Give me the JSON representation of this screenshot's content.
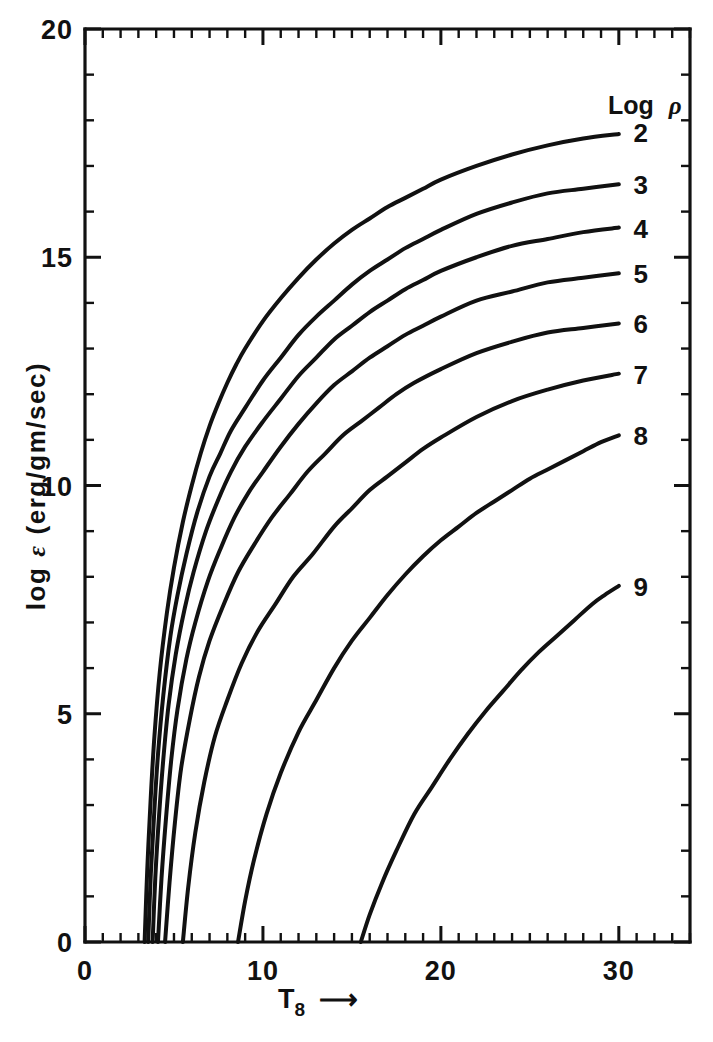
{
  "chart_data": {
    "type": "line",
    "title": "",
    "xlabel": "T8",
    "xlabel_display": "T",
    "xlabel_sub": "8",
    "xlabel_arrow": "⟶",
    "ylabel": "log ε (erg/gm/sec)",
    "ylabel_parts": {
      "prefix": "log",
      "symbol": "ε",
      "units": "(erg/gm/sec)"
    },
    "xlim": [
      0,
      34
    ],
    "ylim": [
      0,
      20
    ],
    "x_major_ticks": [
      0,
      10,
      20,
      30
    ],
    "x_major_tick_labels": [
      "0",
      "10",
      "20",
      "30"
    ],
    "x_minor_tick_interval": 1,
    "y_major_ticks": [
      0,
      5,
      10,
      15,
      20
    ],
    "y_major_tick_labels": [
      "0",
      "5",
      "10",
      "15",
      "20"
    ],
    "y_minor_tick_interval": 1,
    "grid": false,
    "legend_position": "right-inline",
    "legend_title": "Log ρ",
    "legend_title_parts": {
      "text": "Log",
      "symbol": "ρ"
    },
    "series": [
      {
        "name": "2",
        "label": "2",
        "label_x": 30.6,
        "label_y": 17.75,
        "x_intercept": 3.35,
        "y_at_30": 17.7,
        "points": [
          [
            3.35,
            0.0
          ],
          [
            3.5,
            1.6
          ],
          [
            3.7,
            3.2
          ],
          [
            3.9,
            4.5
          ],
          [
            4.2,
            5.9
          ],
          [
            4.6,
            7.2
          ],
          [
            5.0,
            8.2
          ],
          [
            5.5,
            9.2
          ],
          [
            6.0,
            10.0
          ],
          [
            6.5,
            10.7
          ],
          [
            7.0,
            11.3
          ],
          [
            7.5,
            11.8
          ],
          [
            8.0,
            12.25
          ],
          [
            8.5,
            12.65
          ],
          [
            9.0,
            13.0
          ],
          [
            10.0,
            13.6
          ],
          [
            11.0,
            14.1
          ],
          [
            12.0,
            14.55
          ],
          [
            13.0,
            14.95
          ],
          [
            14.0,
            15.3
          ],
          [
            15.0,
            15.6
          ],
          [
            16.0,
            15.85
          ],
          [
            17.0,
            16.1
          ],
          [
            18.0,
            16.3
          ],
          [
            19.0,
            16.5
          ],
          [
            20.0,
            16.7
          ],
          [
            22.0,
            17.0
          ],
          [
            24.0,
            17.25
          ],
          [
            26.0,
            17.45
          ],
          [
            28.0,
            17.6
          ],
          [
            30.0,
            17.7
          ]
        ]
      },
      {
        "name": "3",
        "label": "3",
        "label_x": 30.6,
        "label_y": 16.6,
        "x_intercept": 3.55,
        "y_at_30": 16.6,
        "points": [
          [
            3.55,
            0.0
          ],
          [
            3.7,
            1.5
          ],
          [
            3.9,
            2.9
          ],
          [
            4.1,
            4.1
          ],
          [
            4.4,
            5.4
          ],
          [
            4.8,
            6.7
          ],
          [
            5.2,
            7.6
          ],
          [
            5.7,
            8.5
          ],
          [
            6.3,
            9.4
          ],
          [
            7.0,
            10.2
          ],
          [
            7.6,
            10.7
          ],
          [
            8.2,
            11.2
          ],
          [
            9.0,
            11.7
          ],
          [
            10.0,
            12.3
          ],
          [
            11.0,
            12.8
          ],
          [
            12.0,
            13.3
          ],
          [
            13.0,
            13.7
          ],
          [
            14.0,
            14.05
          ],
          [
            15.0,
            14.4
          ],
          [
            16.0,
            14.7
          ],
          [
            17.0,
            14.95
          ],
          [
            18.0,
            15.2
          ],
          [
            19.0,
            15.4
          ],
          [
            20.0,
            15.6
          ],
          [
            22.0,
            15.95
          ],
          [
            24.0,
            16.2
          ],
          [
            26.0,
            16.4
          ],
          [
            28.0,
            16.5
          ],
          [
            30.0,
            16.6
          ]
        ]
      },
      {
        "name": "4",
        "label": "4",
        "label_x": 30.6,
        "label_y": 15.65,
        "x_intercept": 3.8,
        "y_at_30": 15.65,
        "points": [
          [
            3.8,
            0.0
          ],
          [
            3.95,
            1.4
          ],
          [
            4.15,
            2.7
          ],
          [
            4.4,
            4.0
          ],
          [
            4.7,
            5.2
          ],
          [
            5.1,
            6.3
          ],
          [
            5.6,
            7.3
          ],
          [
            6.1,
            8.1
          ],
          [
            6.8,
            9.0
          ],
          [
            7.5,
            9.7
          ],
          [
            8.2,
            10.3
          ],
          [
            9.0,
            10.85
          ],
          [
            10.0,
            11.4
          ],
          [
            11.0,
            11.9
          ],
          [
            12.0,
            12.4
          ],
          [
            13.0,
            12.8
          ],
          [
            14.0,
            13.2
          ],
          [
            15.0,
            13.5
          ],
          [
            16.0,
            13.8
          ],
          [
            17.0,
            14.05
          ],
          [
            18.0,
            14.3
          ],
          [
            19.0,
            14.5
          ],
          [
            20.0,
            14.7
          ],
          [
            22.0,
            15.0
          ],
          [
            24.0,
            15.25
          ],
          [
            26.0,
            15.4
          ],
          [
            28.0,
            15.55
          ],
          [
            30.0,
            15.65
          ]
        ]
      },
      {
        "name": "5",
        "label": "5",
        "label_x": 30.6,
        "label_y": 14.65,
        "x_intercept": 4.1,
        "y_at_30": 14.65,
        "points": [
          [
            4.1,
            0.0
          ],
          [
            4.3,
            1.4
          ],
          [
            4.55,
            2.7
          ],
          [
            4.85,
            4.0
          ],
          [
            5.2,
            5.1
          ],
          [
            5.7,
            6.2
          ],
          [
            6.2,
            7.0
          ],
          [
            6.9,
            7.9
          ],
          [
            7.6,
            8.6
          ],
          [
            8.4,
            9.3
          ],
          [
            9.2,
            9.85
          ],
          [
            10.0,
            10.3
          ],
          [
            11.0,
            10.85
          ],
          [
            12.0,
            11.35
          ],
          [
            13.0,
            11.8
          ],
          [
            14.0,
            12.2
          ],
          [
            15.0,
            12.5
          ],
          [
            16.0,
            12.8
          ],
          [
            17.0,
            13.05
          ],
          [
            18.0,
            13.3
          ],
          [
            19.0,
            13.5
          ],
          [
            20.0,
            13.7
          ],
          [
            22.0,
            14.05
          ],
          [
            24.0,
            14.25
          ],
          [
            26.0,
            14.45
          ],
          [
            28.0,
            14.55
          ],
          [
            30.0,
            14.65
          ]
        ]
      },
      {
        "name": "6",
        "label": "6",
        "label_x": 30.6,
        "label_y": 13.55,
        "x_intercept": 4.5,
        "y_at_30": 13.55,
        "points": [
          [
            4.5,
            0.0
          ],
          [
            4.75,
            1.3
          ],
          [
            5.05,
            2.6
          ],
          [
            5.4,
            3.8
          ],
          [
            5.9,
            4.9
          ],
          [
            6.4,
            5.8
          ],
          [
            7.0,
            6.6
          ],
          [
            7.8,
            7.4
          ],
          [
            8.6,
            8.1
          ],
          [
            9.5,
            8.7
          ],
          [
            10.5,
            9.3
          ],
          [
            11.5,
            9.8
          ],
          [
            12.5,
            10.3
          ],
          [
            13.5,
            10.7
          ],
          [
            14.5,
            11.1
          ],
          [
            15.5,
            11.4
          ],
          [
            16.5,
            11.7
          ],
          [
            17.5,
            12.0
          ],
          [
            18.5,
            12.25
          ],
          [
            20.0,
            12.55
          ],
          [
            22.0,
            12.9
          ],
          [
            24.0,
            13.15
          ],
          [
            26.0,
            13.35
          ],
          [
            28.0,
            13.45
          ],
          [
            30.0,
            13.55
          ]
        ]
      },
      {
        "name": "7",
        "label": "7",
        "label_x": 30.6,
        "label_y": 12.45,
        "x_intercept": 5.5,
        "y_at_30": 12.45,
        "points": [
          [
            5.5,
            0.0
          ],
          [
            5.8,
            1.2
          ],
          [
            6.2,
            2.4
          ],
          [
            6.7,
            3.5
          ],
          [
            7.3,
            4.5
          ],
          [
            8.0,
            5.3
          ],
          [
            8.8,
            6.1
          ],
          [
            9.7,
            6.8
          ],
          [
            10.7,
            7.4
          ],
          [
            11.7,
            8.0
          ],
          [
            12.8,
            8.5
          ],
          [
            14.0,
            9.1
          ],
          [
            15.0,
            9.5
          ],
          [
            16.0,
            9.9
          ],
          [
            17.0,
            10.2
          ],
          [
            18.0,
            10.5
          ],
          [
            19.0,
            10.8
          ],
          [
            20.0,
            11.05
          ],
          [
            22.0,
            11.5
          ],
          [
            24.0,
            11.85
          ],
          [
            26.0,
            12.1
          ],
          [
            28.0,
            12.3
          ],
          [
            30.0,
            12.45
          ]
        ]
      },
      {
        "name": "8",
        "label": "8",
        "label_x": 30.6,
        "label_y": 11.1,
        "x_intercept": 8.6,
        "y_at_30": 11.1,
        "points": [
          [
            8.6,
            0.0
          ],
          [
            9.0,
            0.9
          ],
          [
            9.5,
            1.8
          ],
          [
            10.2,
            2.8
          ],
          [
            11.0,
            3.7
          ],
          [
            12.0,
            4.6
          ],
          [
            13.0,
            5.3
          ],
          [
            14.0,
            6.0
          ],
          [
            15.0,
            6.6
          ],
          [
            16.0,
            7.1
          ],
          [
            17.0,
            7.6
          ],
          [
            18.0,
            8.05
          ],
          [
            19.0,
            8.45
          ],
          [
            20.0,
            8.8
          ],
          [
            21.0,
            9.1
          ],
          [
            22.0,
            9.4
          ],
          [
            23.0,
            9.65
          ],
          [
            24.0,
            9.9
          ],
          [
            25.0,
            10.15
          ],
          [
            26.0,
            10.35
          ],
          [
            27.0,
            10.55
          ],
          [
            28.0,
            10.75
          ],
          [
            29.0,
            10.95
          ],
          [
            30.0,
            11.1
          ]
        ]
      },
      {
        "name": "9",
        "label": "9",
        "label_x": 30.6,
        "label_y": 7.8,
        "x_intercept": 15.5,
        "y_at_30": 7.8,
        "points": [
          [
            15.5,
            0.0
          ],
          [
            16.0,
            0.6
          ],
          [
            16.7,
            1.3
          ],
          [
            17.5,
            2.0
          ],
          [
            18.5,
            2.8
          ],
          [
            19.5,
            3.4
          ],
          [
            20.5,
            4.0
          ],
          [
            21.5,
            4.55
          ],
          [
            22.5,
            5.05
          ],
          [
            23.5,
            5.5
          ],
          [
            24.5,
            5.95
          ],
          [
            25.5,
            6.35
          ],
          [
            26.5,
            6.7
          ],
          [
            27.5,
            7.05
          ],
          [
            28.5,
            7.4
          ],
          [
            29.2,
            7.6
          ],
          [
            30.0,
            7.8
          ]
        ]
      }
    ]
  }
}
